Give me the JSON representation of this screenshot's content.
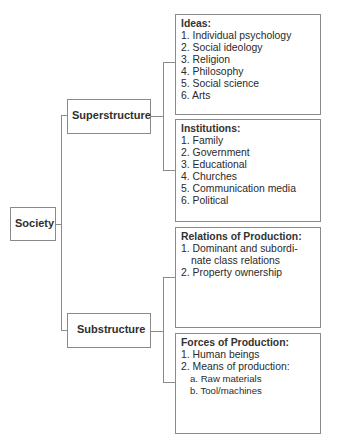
{
  "diagram": {
    "root": {
      "label": "Society"
    },
    "branches": [
      {
        "label": "Superstructure",
        "panels": [
          {
            "title": "Ideas:",
            "items": [
              "1. Individual psychology",
              "2. Social ideology",
              "3. Religion",
              "4. Philosophy",
              "5. Social science",
              "6. Arts"
            ]
          },
          {
            "title": "Institutions:",
            "items": [
              "1. Family",
              "2. Government",
              "3. Educational",
              "4. Churches",
              "5. Communication media",
              "6. Political"
            ]
          }
        ]
      },
      {
        "label": "Substructure",
        "panels": [
          {
            "title": "Relations of Production:",
            "items": [
              "1. Dominant and subordi-nate class relations",
              "2. Property ownership"
            ]
          },
          {
            "title": "Forces of Production:",
            "items": [
              "1.  Human beings",
              "2.  Means of production:"
            ],
            "subitems": [
              "a. Raw materials",
              "b. Tool/machines"
            ]
          }
        ]
      }
    ]
  },
  "colors": {
    "line": "#8a8a8a",
    "text": "#2a2a2a",
    "background": "#ffffff"
  }
}
